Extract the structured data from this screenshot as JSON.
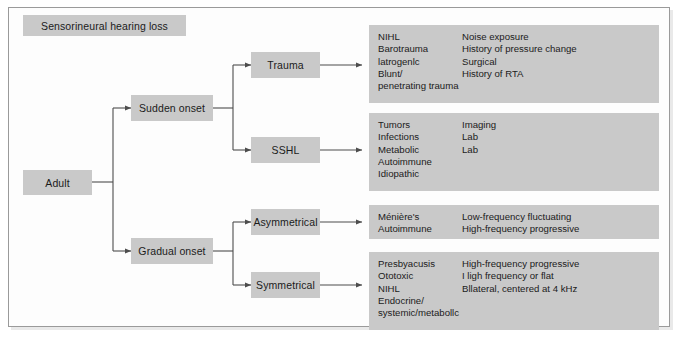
{
  "figure": {
    "title_box": {
      "label": "Sensorineural hearing loss"
    },
    "colors": {
      "box_fill": "#c9c9c9",
      "text": "#1b1b1b",
      "connector": "#4d4d4d",
      "page_border": "#9a9a9a",
      "page_background": "#ffffff"
    }
  },
  "nodes": {
    "root": {
      "label": "Adult"
    },
    "sudden_onset": {
      "label": "Sudden onset"
    },
    "gradual_onset": {
      "label": "Gradual onset"
    },
    "trauma": {
      "label": "Trauma"
    },
    "sshl": {
      "label": "SSHL"
    },
    "asymmetrical": {
      "label": "Asymmetrical"
    },
    "symmetrical": {
      "label": "Symmetrical"
    }
  },
  "panels": {
    "trauma": {
      "rows": [
        {
          "cause": "NIHL",
          "finding": "Noise exposure"
        },
        {
          "cause": "Barotrauma",
          "finding": "History of pressure change"
        },
        {
          "cause": "latrogenlc",
          "finding": "Surgical"
        },
        {
          "cause": "Blunt/",
          "finding": "History of RTA"
        },
        {
          "cause": "penetrating trauma",
          "finding": ""
        }
      ]
    },
    "sshl": {
      "rows": [
        {
          "cause": "Tumors",
          "finding": "Imaging"
        },
        {
          "cause": "Infections",
          "finding": "Lab"
        },
        {
          "cause": "Metabolic",
          "finding": "Lab"
        },
        {
          "cause": "Autoimmune",
          "finding": ""
        },
        {
          "cause": "Idiopathic",
          "finding": ""
        }
      ]
    },
    "asymmetrical": {
      "rows": [
        {
          "cause": "Ménière's",
          "finding": "Low-frequency fluctuating"
        },
        {
          "cause": "Autoimmune",
          "finding": "High-frequency progressive"
        }
      ]
    },
    "symmetrical": {
      "rows": [
        {
          "cause": "Presbyacusis",
          "finding": "High-frequency progressive"
        },
        {
          "cause": "Ototoxic",
          "finding": "I ligh frequency or flat"
        },
        {
          "cause": "NIHL",
          "finding": "Bllateral, centered at 4 kHz"
        },
        {
          "cause": "Endocrine/",
          "finding": ""
        },
        {
          "cause": "systemic/metabollc",
          "finding": ""
        }
      ]
    }
  }
}
